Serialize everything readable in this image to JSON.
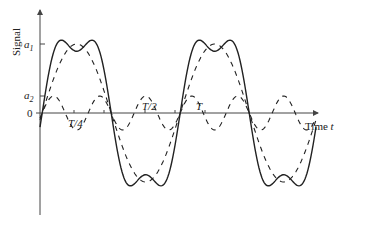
{
  "figure": {
    "y_axis_label": "Signal",
    "x_axis_label": "Time",
    "x_axis_var": "t",
    "y_ticks": [
      {
        "label_main": "a",
        "label_sub": "1",
        "value": "a1"
      },
      {
        "label_main": "a",
        "label_sub": "2",
        "value": "a2"
      },
      {
        "label_main": "0",
        "label_sub": "",
        "value": "0"
      }
    ],
    "x_ticks": [
      {
        "label": "T/4"
      },
      {
        "label": "T/2"
      },
      {
        "label": "T"
      }
    ],
    "colors": {
      "line": "#222222",
      "axis": "#444444",
      "background": "#ffffff"
    }
  },
  "chart_data": {
    "type": "line",
    "title": "",
    "xlabel": "Time t",
    "ylabel": "Signal",
    "series": [
      {
        "name": "fundamental (dashed)",
        "style": "dashed",
        "amplitude": "a1",
        "harmonic": 1
      },
      {
        "name": "third harmonic (dashed)",
        "style": "dashed",
        "amplitude": "a2",
        "harmonic": 3
      },
      {
        "name": "sum (solid)",
        "style": "solid",
        "description": "fundamental + third harmonic, flattened troughs"
      }
    ],
    "x_range_periods": [
      0,
      2.0
    ],
    "grid": false
  }
}
